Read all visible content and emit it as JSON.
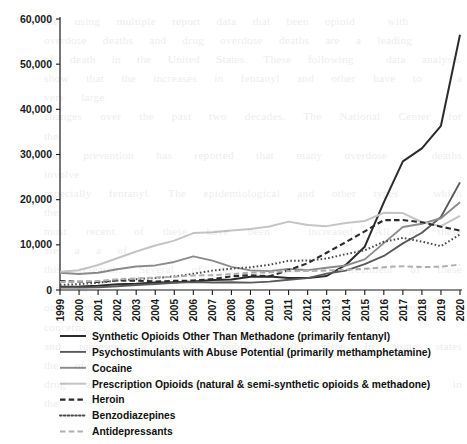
{
  "chart_data": {
    "type": "line",
    "title": "",
    "subtitle": "",
    "xlabel": "",
    "ylabel": "",
    "grid": false,
    "legend_position": "bottom-left",
    "xlim": [
      1999,
      2020
    ],
    "ylim": [
      0,
      60000
    ],
    "yticks": [
      0,
      10000,
      20000,
      30000,
      40000,
      50000,
      60000
    ],
    "ytick_labels": [
      "0",
      "10,000",
      "20,000",
      "30,000",
      "40,000",
      "50,000",
      "60,000"
    ],
    "x": [
      1999,
      2000,
      2001,
      2002,
      2003,
      2004,
      2005,
      2006,
      2007,
      2008,
      2009,
      2010,
      2011,
      2012,
      2013,
      2014,
      2015,
      2016,
      2017,
      2018,
      2019,
      2020
    ],
    "xtick_labels": [
      "1999",
      "2000",
      "2001",
      "2002",
      "2003",
      "2004",
      "2005",
      "2006",
      "2007",
      "2008",
      "2009",
      "2010",
      "2011",
      "2012",
      "2013",
      "2014",
      "2015",
      "2016",
      "2017",
      "2018",
      "2019",
      "2020"
    ],
    "series": [
      {
        "name": "Synthetic Opioids Other Than Methadone (primarily fentanyl)",
        "style": "solid",
        "color": "#2b2b2b",
        "width": 2.0,
        "values": [
          730,
          780,
          950,
          1300,
          1400,
          1660,
          1740,
          1900,
          2210,
          2310,
          2950,
          3010,
          2670,
          2630,
          3100,
          5540,
          9580,
          19410,
          28470,
          31340,
          36360,
          56516
        ]
      },
      {
        "name": "Psychostimulants with Abuse Potential (primarily methamphetamine)",
        "style": "solid",
        "color": "#5a5a5a",
        "width": 1.9,
        "values": [
          550,
          570,
          600,
          840,
          1070,
          1330,
          1610,
          1780,
          1650,
          1730,
          1630,
          1850,
          2270,
          2630,
          3630,
          4300,
          5720,
          7540,
          10330,
          12680,
          16170,
          23837
        ]
      },
      {
        "name": "Cocaine",
        "style": "solid",
        "color": "#8c8c8c",
        "width": 1.9,
        "values": [
          3820,
          3540,
          3830,
          4600,
          5200,
          5440,
          6210,
          7450,
          6510,
          5130,
          4350,
          4180,
          4680,
          4400,
          4940,
          5420,
          6780,
          10380,
          13940,
          14670,
          15880,
          19447
        ]
      },
      {
        "name": "Prescription Opioids (natural & semi-synthetic opioids & methadone)",
        "style": "solid",
        "color": "#c4c4c4",
        "width": 2.0,
        "values": [
          4030,
          4400,
          5530,
          7030,
          8520,
          9860,
          10930,
          12600,
          12800,
          13150,
          13520,
          14060,
          15140,
          14370,
          14140,
          14840,
          15280,
          17087,
          17029,
          15003,
          14139,
          16416
        ]
      },
      {
        "name": "Heroin",
        "style": "dashed",
        "color": "#2b2b2b",
        "width": 2.1,
        "values": [
          1960,
          1840,
          1780,
          2090,
          2080,
          1880,
          2010,
          2090,
          2400,
          3040,
          3280,
          3036,
          4397,
          5925,
          8257,
          10574,
          12989,
          15469,
          15482,
          14996,
          14019,
          13165
        ]
      },
      {
        "name": "Benzodiazepines",
        "style": "dotted",
        "color": "#4a4a4a",
        "width": 2.0,
        "values": [
          1120,
          1300,
          1600,
          2090,
          2400,
          2660,
          3020,
          3600,
          4290,
          4730,
          5010,
          5600,
          6480,
          6520,
          6970,
          7945,
          8791,
          10684,
          11537,
          10724,
          9711,
          12290
        ]
      },
      {
        "name": "Antidepressants",
        "style": "dashed",
        "color": "#b0b0b0",
        "width": 2.0,
        "values": [
          1750,
          1820,
          2010,
          2380,
          2570,
          2740,
          2950,
          3220,
          3280,
          3530,
          3850,
          3900,
          4180,
          4200,
          4320,
          4500,
          4690,
          5047,
          5269,
          5064,
          5175,
          5597
        ]
      }
    ]
  },
  "legend": {
    "items": [
      {
        "label": "Synthetic Opioids Other Than Methadone (primarily fentanyl)"
      },
      {
        "label": "Psychostimulants with Abuse Potential (primarily methamphetamine)"
      },
      {
        "label": "Cocaine"
      },
      {
        "label": "Prescription Opioids (natural & semi-synthetic opioids & methadone)"
      },
      {
        "label": "Heroin"
      },
      {
        "label": "Benzodiazepines"
      },
      {
        "label": "Antidepressants"
      }
    ]
  },
  "background_bleed": {
    "visible": true,
    "lines": [
      "the  using  multiple  report  data  that  been  opioid    with",
      "overdose  deaths  and  drug  overdose  deaths  are  a  leading",
      "of  death  in  the  United  States.  These  following    data  analysis",
      "show  that  the  increases  in  fentanyl  and  other  have  to    a  very  large",
      "changes  over  the  past  two  decades.  The  National  Center  for  the",
      "and  prevention  has  reported  that  many  overdose    deaths  involve",
      "especially  fentanyl.  The  epidemiological  and  other  types    which  the",
      "most  recent  of  these  have  been    increased.  All  of  these  are  a  a  of",
      "this  research.  Several  of  the  approaches  to  treatment  of  these  and  so",
      "on  some  other  issues.  These  data  suggest  a  number  of  concerns",
      "and  represent  a  growing  public  health  crisis.  In  some  states  the  of",
      "drug  and  the  reported  deaths  have  increased  substantially  in  the"
    ]
  }
}
